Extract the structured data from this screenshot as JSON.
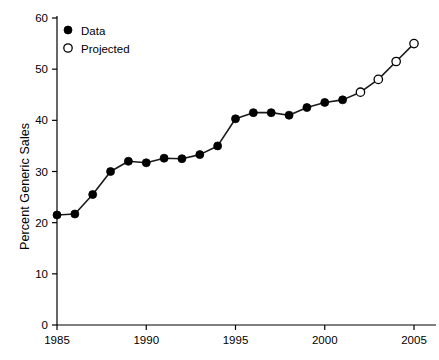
{
  "chart_data": {
    "type": "line",
    "title": "",
    "xlabel": "",
    "ylabel": "Percent Generic Sales",
    "xlim": [
      1985,
      2005
    ],
    "ylim": [
      0,
      60
    ],
    "xticks": [
      1985,
      1990,
      1995,
      2000,
      2005
    ],
    "yticks": [
      0,
      10,
      20,
      30,
      40,
      50,
      60
    ],
    "grid": false,
    "legend_position": "top-left",
    "x": [
      1985,
      1986,
      1987,
      1988,
      1989,
      1990,
      1991,
      1992,
      1993,
      1994,
      1995,
      1996,
      1997,
      1998,
      1999,
      2000,
      2001,
      2002,
      2003,
      2004,
      2005
    ],
    "series": [
      {
        "name": "Data",
        "marker": "filled-circle",
        "color": "#000000",
        "x": [
          1985,
          1986,
          1987,
          1988,
          1989,
          1990,
          1991,
          1992,
          1993,
          1994,
          1995,
          1996,
          1997,
          1998,
          1999,
          2000,
          2001
        ],
        "values": [
          21.5,
          21.7,
          25.5,
          30.0,
          32.0,
          31.7,
          32.6,
          32.5,
          33.3,
          35.0,
          40.3,
          41.5,
          41.5,
          41.0,
          42.5,
          43.5,
          44.0
        ]
      },
      {
        "name": "Projected",
        "marker": "open-circle",
        "color": "#ffffff",
        "x": [
          2002,
          2003,
          2004,
          2005
        ],
        "values": [
          45.5,
          48.0,
          51.5,
          55.0
        ]
      }
    ],
    "all_values": [
      21.5,
      21.7,
      25.5,
      30.0,
      32.0,
      31.7,
      32.6,
      32.5,
      33.3,
      35.0,
      40.3,
      41.5,
      41.5,
      41.0,
      42.5,
      43.5,
      44.0,
      45.5,
      48.0,
      51.5,
      55.0,
      60.0
    ]
  },
  "legend": {
    "items": [
      {
        "label": "Data",
        "marker": "filled-circle"
      },
      {
        "label": "Projected",
        "marker": "open-circle"
      }
    ]
  },
  "axes": {
    "y": {
      "label": "Percent Generic Sales",
      "ticks": [
        "0",
        "10",
        "20",
        "30",
        "40",
        "50",
        "60"
      ]
    },
    "x": {
      "ticks": [
        "1985",
        "1990",
        "1995",
        "2000",
        "2005"
      ]
    }
  },
  "colors": {
    "line": "#1a1a1a",
    "marker_fill": "#000000",
    "marker_open_fill": "#ffffff",
    "axis": "#000000",
    "background": "#ffffff"
  }
}
